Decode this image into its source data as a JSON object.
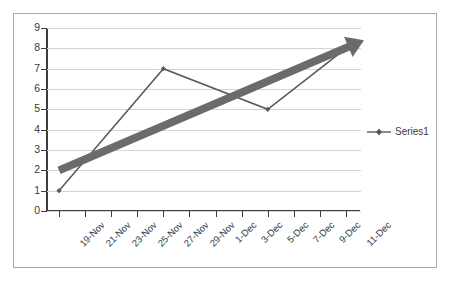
{
  "chart_data": {
    "type": "line",
    "title": "",
    "xlabel": "",
    "ylabel": "",
    "grid": true,
    "legend_position": "right",
    "categories": [
      "19-Nov",
      "21-Nov",
      "23-Nov",
      "25-Nov",
      "27-Nov",
      "29-Nov",
      "1-Dec",
      "3-Dec",
      "5-Dec",
      "7-Dec",
      "9-Dec",
      "11-Dec"
    ],
    "y_ticks": [
      0,
      1,
      2,
      3,
      4,
      5,
      6,
      7,
      8,
      9
    ],
    "ylim": [
      0,
      9
    ],
    "series": [
      {
        "name": "Series1",
        "color": "#595959",
        "marker": "diamond",
        "points": [
          {
            "x": "19-Nov",
            "y": 1
          },
          {
            "x": "27-Nov",
            "y": 7
          },
          {
            "x": "5-Dec",
            "y": 5
          },
          {
            "x": "11-Dec",
            "y": 8
          }
        ],
        "values": [
          1,
          null,
          null,
          null,
          7,
          null,
          null,
          null,
          5,
          null,
          null,
          8
        ]
      }
    ],
    "annotations": [
      {
        "type": "arrow-trendline",
        "color": "#6b6b6b",
        "from": {
          "x": "19-Nov",
          "y": 2
        },
        "to": {
          "x": "11-Dec",
          "y": 8.4
        },
        "thickness_px": 8
      }
    ]
  },
  "legend": {
    "entries": [
      {
        "label": "Series1",
        "color": "#595959",
        "marker": "diamond"
      }
    ]
  },
  "axes": {
    "y_labels": [
      "9",
      "8",
      "7",
      "6",
      "5",
      "4",
      "3",
      "2",
      "1",
      "0"
    ],
    "x_labels": [
      "19-Nov",
      "21-Nov",
      "23-Nov",
      "25-Nov",
      "27-Nov",
      "29-Nov",
      "1-Dec",
      "3-Dec",
      "5-Dec",
      "7-Dec",
      "9-Dec",
      "11-Dec"
    ]
  },
  "colors": {
    "series_line": "#595959",
    "trend_arrow": "#6b6b6b",
    "gridline": "#d4d4d4",
    "axis": "#3c3c3c",
    "frame_border": "#a9a9a9",
    "text": "#3a3a3a",
    "background": "#ffffff"
  }
}
